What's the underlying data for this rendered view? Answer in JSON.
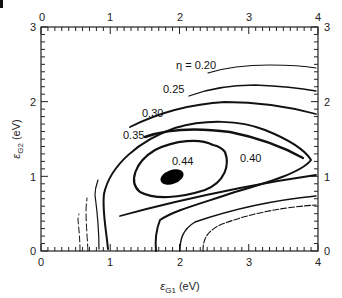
{
  "chart_data": {
    "type": "contour",
    "title": "",
    "xlabel": "εG1 (eV)",
    "ylabel": "εG2 (eV)",
    "xlabel_main": "ε",
    "xlabel_sub": "G1",
    "xlabel_unit": " (eV)",
    "ylabel_main": "ε",
    "ylabel_sub": "G2",
    "ylabel_unit": " (eV)",
    "xlim": [
      0,
      4
    ],
    "ylim": [
      0,
      3
    ],
    "x_ticks": [
      "0",
      "1",
      "2",
      "3",
      "4"
    ],
    "y_ticks": [
      "0",
      "1",
      "2",
      "3"
    ],
    "top_ticks": [
      "0",
      "1",
      "2",
      "3",
      "4"
    ],
    "right_ticks": [
      "0",
      "1",
      "2",
      "3"
    ],
    "grid": false,
    "legend": null,
    "contour_variable": "η",
    "contour_levels": [
      {
        "level": 0.2,
        "label": "η = 0.20",
        "label_pos": [
          1.95,
          2.3
        ]
      },
      {
        "level": 0.25,
        "label": "0.25",
        "label_pos": [
          1.75,
          2.05
        ]
      },
      {
        "level": 0.3,
        "label": "0.30",
        "label_pos": [
          1.3,
          1.75
        ]
      },
      {
        "level": 0.35,
        "label": "0.35",
        "label_pos": [
          0.95,
          1.45
        ]
      },
      {
        "level": 0.4,
        "label": "0.40",
        "label_pos": [
          2.95,
          1.0
        ]
      },
      {
        "level": 0.44,
        "label": "0.44",
        "label_pos": [
          1.9,
          1.15
        ]
      }
    ],
    "peak": {
      "x": 1.8,
      "y": 1.0,
      "value": 0.44
    }
  }
}
